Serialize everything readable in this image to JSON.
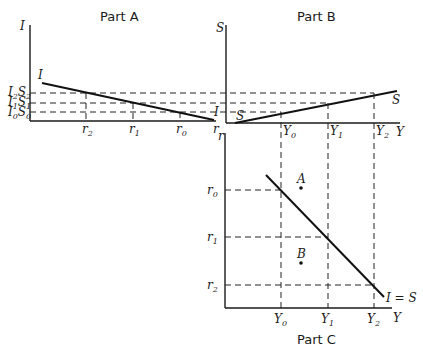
{
  "panels": {
    "a": {
      "title": "Part A",
      "y_axis_label": "I",
      "x_axis_label": "r",
      "curve_label": "I",
      "curve_end_label": "I",
      "y_ticks": [
        {
          "main": "I",
          "main_sub": "2",
          "second": "S",
          "second_sub": "2"
        },
        {
          "main": "I",
          "main_sub": "1",
          "second": "S",
          "second_sub": "1"
        },
        {
          "main": "I",
          "main_sub": "0",
          "second": "S",
          "second_sub": "0"
        }
      ],
      "x_ticks": [
        {
          "main": "r",
          "sub": "2"
        },
        {
          "main": "r",
          "sub": "1"
        },
        {
          "main": "r",
          "sub": "0"
        }
      ]
    },
    "b": {
      "title": "Part B",
      "y_axis_label": "S",
      "x_axis_label": "Y",
      "curve_label": "S",
      "curve_start_label": "S",
      "x_ticks": [
        {
          "main": "Y",
          "sub": "0"
        },
        {
          "main": "Y",
          "sub": "1"
        },
        {
          "main": "Y",
          "sub": "2"
        }
      ]
    },
    "c": {
      "title": "Part C",
      "y_axis_label": "r",
      "x_axis_label": "Y",
      "curve_label": "I = S",
      "points": [
        {
          "label": "A"
        },
        {
          "label": "B"
        }
      ],
      "y_ticks": [
        {
          "main": "r",
          "sub": "0"
        },
        {
          "main": "r",
          "sub": "1"
        },
        {
          "main": "r",
          "sub": "2"
        }
      ],
      "x_ticks": [
        {
          "main": "Y",
          "sub": "0"
        },
        {
          "main": "Y",
          "sub": "1"
        },
        {
          "main": "Y",
          "sub": "2"
        }
      ]
    }
  }
}
